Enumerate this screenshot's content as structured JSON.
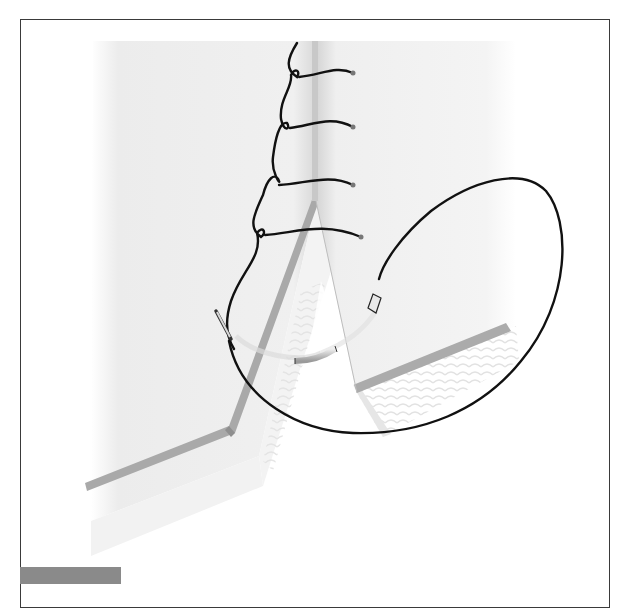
{
  "figure": {
    "type": "medical-illustration",
    "stitch_count": 4,
    "colors": {
      "frame_border": "#3a3a3a",
      "background": "#ffffff",
      "tissue": "#eeeeee",
      "tissue_shadow": "#d6d6d6",
      "dermis_band": "#a8a8a8",
      "suture": "#111111",
      "needle": "#c8c8c8",
      "label_bar": "#8a8a8a"
    }
  },
  "label_bar": {
    "text": ""
  }
}
